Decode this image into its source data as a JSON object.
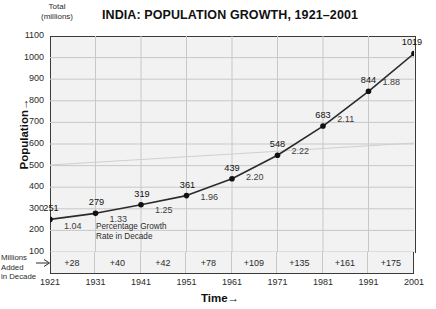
{
  "header": {
    "title": "INDIA: POPULATION GROWTH, 1921–2001",
    "unit_label_line1": "Total",
    "unit_label_line2": "(millions)"
  },
  "axes": {
    "y_title": "Population→",
    "x_title": "Time→"
  },
  "annotations": {
    "growth_rate_line1": "Percentage Growth",
    "growth_rate_line2": "Rate in Decade",
    "millions_added_line1": "Millions Added",
    "millions_added_line2": "in Decade",
    "millions_added_arrow_icon": "right-arrow-icon"
  },
  "chart_data": {
    "type": "line",
    "title": "INDIA: POPULATION GROWTH, 1921–2001",
    "xlabel": "Time→",
    "ylabel": "Population→",
    "y_unit": "millions",
    "xlim": [
      1921,
      2001
    ],
    "ylim": [
      100,
      1100
    ],
    "y_ticks": [
      1100,
      1000,
      900,
      800,
      700,
      600,
      500,
      400,
      300,
      200,
      100
    ],
    "x_ticks": [
      1921,
      1931,
      1941,
      1951,
      1961,
      1971,
      1981,
      1991,
      2001
    ],
    "grid": true,
    "legend": "none",
    "categories": [
      "1921",
      "1931",
      "1941",
      "1951",
      "1961",
      "1971",
      "1981",
      "1991",
      "2001"
    ],
    "values": [
      251,
      279,
      319,
      361,
      439,
      548,
      683,
      844,
      1019
    ],
    "point_labels": [
      "251",
      "279",
      "319",
      "361",
      "439",
      "548",
      "683",
      "844",
      "1019"
    ],
    "growth_rate_labels": [
      "1.04",
      "1.33",
      "1.25",
      "1.96",
      "2.20",
      "2.22",
      "2.11",
      "1.88"
    ],
    "growth_rate_values": [
      1.04,
      1.33,
      1.25,
      1.96,
      2.2,
      2.22,
      2.11,
      1.88
    ],
    "millions_added_labels": [
      "+28",
      "+40",
      "+42",
      "+78",
      "+109",
      "+135",
      "+161",
      "+175"
    ],
    "millions_added_values": [
      28,
      40,
      42,
      78,
      109,
      135,
      161,
      175
    ],
    "series_color": "#2b2b2b",
    "marker_color": "#111111",
    "plot_background": "#f2f2f2",
    "grid_color": "#c8c8c8",
    "trendline_color": "#cfcfcf"
  }
}
